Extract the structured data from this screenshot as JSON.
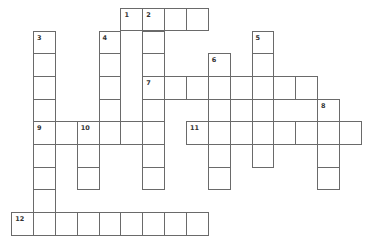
{
  "puzzle": {
    "cell_width": 21.85,
    "cell_height": 22.7,
    "origin_x": 11.7,
    "origin_y": 8.3,
    "border_color": "#6a6a6a",
    "number_color": "#333333"
  },
  "words": [
    {
      "number": "1",
      "direction": "across",
      "row": 0,
      "col": 5,
      "length": 4
    },
    {
      "number": "2",
      "direction": "down",
      "row": 0,
      "col": 6,
      "length": 8
    },
    {
      "number": "3",
      "direction": "down",
      "row": 1,
      "col": 1,
      "length": 9
    },
    {
      "number": "4",
      "direction": "down",
      "row": 1,
      "col": 4,
      "length": 5
    },
    {
      "number": "5",
      "direction": "down",
      "row": 1,
      "col": 11,
      "length": 6
    },
    {
      "number": "6",
      "direction": "down",
      "row": 2,
      "col": 9,
      "length": 6
    },
    {
      "number": "7",
      "direction": "across",
      "row": 3,
      "col": 6,
      "length": 8
    },
    {
      "number": "8",
      "direction": "down",
      "row": 4,
      "col": 14,
      "length": 4
    },
    {
      "number": "9",
      "direction": "across",
      "row": 5,
      "col": 1,
      "length": 6
    },
    {
      "number": "10",
      "direction": "down",
      "row": 5,
      "col": 3,
      "length": 3
    },
    {
      "number": "11",
      "direction": "across",
      "row": 5,
      "col": 8,
      "length": 8
    },
    {
      "number": "12",
      "direction": "across",
      "row": 9,
      "col": 0,
      "length": 9
    }
  ]
}
